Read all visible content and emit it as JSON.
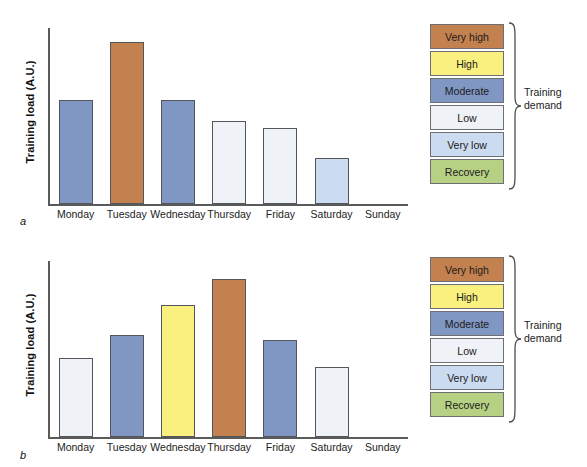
{
  "figure": {
    "panels": [
      {
        "letter": "a",
        "ylabel": "Training load (A.U.)",
        "categories": [
          "Monday",
          "Tuesday",
          "Wednesday",
          "Thursday",
          "Friday",
          "Saturday",
          "Sunday"
        ],
        "values": [
          59,
          92,
          59,
          47,
          43,
          26,
          0
        ],
        "demands": [
          "Moderate",
          "Very high",
          "Moderate",
          "Low",
          "Low",
          "Very low",
          "Recovery"
        ]
      },
      {
        "letter": "b",
        "ylabel": "Training load (A.U.)",
        "categories": [
          "Monday",
          "Tuesday",
          "Wednesday",
          "Thursday",
          "Friday",
          "Saturday",
          "Sunday"
        ],
        "values": [
          45,
          58,
          75,
          90,
          55,
          40,
          0
        ],
        "demands": [
          "Low",
          "Moderate",
          "High",
          "Very high",
          "Moderate",
          "Low",
          "Recovery"
        ]
      }
    ],
    "legend": {
      "title_line1": "Training",
      "title_line2": "demand",
      "items": [
        {
          "label": "Very high",
          "color": "#c2814f"
        },
        {
          "label": "High",
          "color": "#f9f07f"
        },
        {
          "label": "Moderate",
          "color": "#8097c4"
        },
        {
          "label": "Low",
          "color": "#eff2f6"
        },
        {
          "label": "Very low",
          "color": "#cbdcf1"
        },
        {
          "label": "Recovery",
          "color": "#b6d184"
        }
      ]
    },
    "colors": {
      "very_high": "#c2814f",
      "high": "#f9f07f",
      "moderate": "#8097c4",
      "low": "#eff2f6",
      "very_low": "#cbdcf1",
      "recovery": "#b6d184",
      "axis": "#5a5a5a",
      "bar_outline": "#53565c"
    }
  },
  "chart_data": {
    "type": "bar",
    "title": "",
    "xlabel": "",
    "ylabel": "Training load (A.U.)",
    "ylim": [
      0,
      100
    ],
    "grid": false,
    "legend_position": "right",
    "panels": [
      {
        "panel": "a",
        "categories": [
          "Monday",
          "Tuesday",
          "Wednesday",
          "Thursday",
          "Friday",
          "Saturday",
          "Sunday"
        ],
        "values": [
          59,
          92,
          59,
          47,
          43,
          26,
          0
        ],
        "category_colors": [
          "#8097c4",
          "#c2814f",
          "#8097c4",
          "#eff2f6",
          "#eff2f6",
          "#cbdcf1",
          "#b6d184"
        ],
        "demand_levels": [
          "Moderate",
          "Very high",
          "Moderate",
          "Low",
          "Low",
          "Very low",
          "Recovery"
        ]
      },
      {
        "panel": "b",
        "categories": [
          "Monday",
          "Tuesday",
          "Wednesday",
          "Thursday",
          "Friday",
          "Saturday",
          "Sunday"
        ],
        "values": [
          45,
          58,
          75,
          90,
          55,
          40,
          0
        ],
        "category_colors": [
          "#eff2f6",
          "#8097c4",
          "#f9f07f",
          "#c2814f",
          "#8097c4",
          "#eff2f6",
          "#b6d184"
        ],
        "demand_levels": [
          "Low",
          "Moderate",
          "High",
          "Very high",
          "Moderate",
          "Low",
          "Recovery"
        ]
      }
    ],
    "legend_entries": [
      "Very high",
      "High",
      "Moderate",
      "Low",
      "Very low",
      "Recovery"
    ],
    "legend_title": "Training demand"
  }
}
